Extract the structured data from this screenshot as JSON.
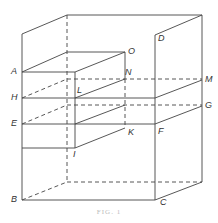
{
  "figure": {
    "caption": "FIG. 1",
    "stroke_color": "#444444",
    "labels": {
      "A": "A",
      "B": "B",
      "C": "C",
      "D": "D",
      "E": "E",
      "F": "F",
      "G": "G",
      "H": "H",
      "I": "I",
      "K": "K",
      "L": "L",
      "M": "M",
      "N": "N",
      "O": "O"
    }
  }
}
